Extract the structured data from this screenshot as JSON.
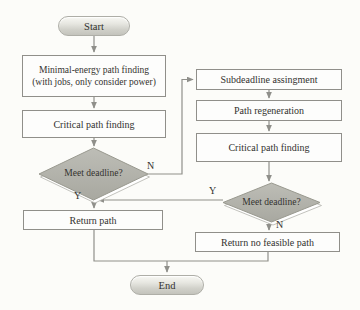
{
  "diagram": {
    "nodes": {
      "start": {
        "label": "Start"
      },
      "minimal_energy": {
        "line1": "Minimal-energy path finding",
        "line2": "(with jobs, only consider power)"
      },
      "critical_path_1": {
        "label": "Critical path finding"
      },
      "decision_1": {
        "label": "Meet deadline?",
        "yes_label": "Y",
        "no_label": "N"
      },
      "return_path": {
        "label": "Return path"
      },
      "subdeadline": {
        "label": "Subdeadline assingment"
      },
      "path_regeneration": {
        "label": "Path regeneration"
      },
      "critical_path_2": {
        "label": "Critical path finding"
      },
      "decision_2": {
        "label": "Meet deadline?",
        "yes_label": "Y",
        "no_label": "N"
      },
      "return_no_feasible": {
        "label": "Return no feasible path"
      },
      "end": {
        "label": "End"
      }
    },
    "colors": {
      "background": "#fcfcf9",
      "line": "#8f8f8a",
      "border": "#908f8a",
      "text": "#33322f",
      "diamond_fill_top": "#bdbdb6",
      "diamond_fill_bottom": "#a8a8a0",
      "oval_fill": "#d9d9d3"
    }
  }
}
